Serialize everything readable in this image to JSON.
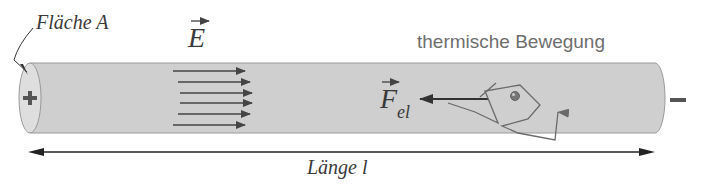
{
  "diagram": {
    "type": "physics-conductor",
    "labels": {
      "area": "Fläche A",
      "field": "E",
      "thermal": "thermische Bewegung",
      "force_main": "F",
      "force_sub": "el",
      "length": "Länge l",
      "plus": "+",
      "minus": "−"
    },
    "colors": {
      "cylinder_fill": "#cfcfcf",
      "end_cap": "#dedede",
      "arrow": "#444444",
      "path": "#6a6a6a",
      "text_dark": "#3a3a3a",
      "text_light": "#6e6e6e"
    },
    "field_arrows_count": 6
  }
}
